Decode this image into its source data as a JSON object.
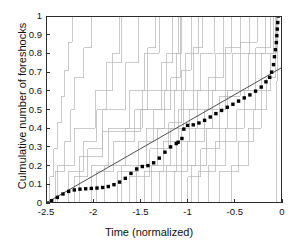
{
  "chart_data": {
    "type": "line",
    "title": "",
    "xlabel": "Time (normalized)",
    "ylabel": "Culmulative number of foreshocks",
    "xlim": [
      -2.5,
      0
    ],
    "ylim": [
      0,
      1
    ],
    "xticks": [
      -2.5,
      -2,
      -1.5,
      -1,
      -0.5,
      0
    ],
    "xticklabels": [
      "-2.5",
      "-2",
      "-1.5",
      "-1",
      "-0.5",
      "0"
    ],
    "yticks": [
      0,
      0.1,
      0.2,
      0.3,
      0.4,
      0.5,
      0.6,
      0.7,
      0.8,
      0.9,
      1
    ],
    "yticklabels": [
      "0",
      "0.1",
      "0.2",
      "0.3",
      "0.4",
      "0.5",
      "0.6",
      "0.7",
      "0.8",
      "0.9",
      "1"
    ],
    "grid": false,
    "legend": null,
    "colors": {
      "stack_lines": "#b3b3b3",
      "reference_line": "#3a3a3a",
      "stacked_mean_dots": "#000000",
      "axis": "#2b2b2b",
      "background": "#ffffff"
    },
    "series": [
      {
        "name": "stacked mean (dotted)",
        "style": "dotted-markers",
        "color": "#000000",
        "marker_size": 3.4,
        "x": [
          -2.5,
          -2.44,
          -2.38,
          -2.32,
          -2.26,
          -2.2,
          -2.14,
          -2.08,
          -2.02,
          -1.96,
          -1.9,
          -1.84,
          -1.78,
          -1.72,
          -1.66,
          -1.6,
          -1.54,
          -1.48,
          -1.42,
          -1.36,
          -1.3,
          -1.24,
          -1.18,
          -1.12,
          -1.1,
          -1.06,
          -1.04,
          -1.0,
          -0.94,
          -0.88,
          -0.82,
          -0.76,
          -0.7,
          -0.64,
          -0.58,
          -0.52,
          -0.46,
          -0.4,
          -0.34,
          -0.28,
          -0.22,
          -0.17,
          -0.13,
          -0.11,
          -0.09,
          -0.08,
          -0.07,
          -0.06,
          -0.055,
          -0.05,
          -0.045,
          -0.04
        ],
        "y": [
          0.0,
          0.012,
          0.03,
          0.048,
          0.062,
          0.07,
          0.074,
          0.076,
          0.078,
          0.08,
          0.083,
          0.088,
          0.098,
          0.112,
          0.132,
          0.158,
          0.182,
          0.195,
          0.2,
          0.215,
          0.24,
          0.272,
          0.3,
          0.318,
          0.325,
          0.345,
          0.395,
          0.415,
          0.418,
          0.428,
          0.442,
          0.46,
          0.478,
          0.495,
          0.512,
          0.528,
          0.545,
          0.562,
          0.578,
          0.598,
          0.62,
          0.648,
          0.672,
          0.7,
          0.74,
          0.782,
          0.82,
          0.858,
          0.895,
          0.93,
          0.965,
          1.0
        ]
      },
      {
        "name": "reference line",
        "style": "solid-thin",
        "color": "#3a3a3a",
        "x": [
          -2.5,
          0.0
        ],
        "y": [
          0.0,
          0.725
        ]
      }
    ],
    "step_curves_note": "26 light-gray individual cumulative step (staircase) curves, each rising from 0 to 1 across the window",
    "step_curves": [
      {
        "x": [
          -2.5,
          -2.46,
          -2.46,
          -2.42,
          -2.42,
          -2.38,
          -2.38,
          -2.34,
          -2.34,
          -2.3,
          -2.3,
          -2.26,
          -2.26,
          -2.22,
          -2.22,
          -2.18,
          -2.18,
          0.0
        ],
        "y": [
          0.0,
          0.0,
          0.14,
          0.14,
          0.29,
          0.29,
          0.43,
          0.43,
          0.57,
          0.57,
          0.71,
          0.71,
          0.86,
          0.86,
          1.0,
          1.0,
          1.0,
          1.0
        ]
      },
      {
        "x": [
          -2.5,
          -2.4,
          -2.4,
          -2.3,
          -2.3,
          -2.24,
          -2.24,
          -2.2,
          -2.2,
          -2.1,
          -2.1,
          -2.02,
          -2.02,
          0.0
        ],
        "y": [
          0.0,
          0.0,
          0.17,
          0.17,
          0.33,
          0.33,
          0.5,
          0.5,
          0.67,
          0.67,
          0.83,
          0.83,
          1.0,
          1.0
        ]
      },
      {
        "x": [
          -2.48,
          -2.38,
          -2.38,
          -2.2,
          -2.2,
          -1.98,
          -1.98,
          -1.8,
          -1.8,
          -1.72,
          -1.72,
          0.0
        ],
        "y": [
          0.0,
          0.0,
          0.2,
          0.2,
          0.4,
          0.4,
          0.6,
          0.6,
          0.8,
          0.8,
          1.0,
          1.0
        ]
      },
      {
        "x": [
          -2.42,
          -2.26,
          -2.26,
          -2.1,
          -2.1,
          -1.96,
          -1.96,
          -1.86,
          -1.86,
          -1.7,
          -1.7,
          0.0
        ],
        "y": [
          0.0,
          0.0,
          0.17,
          0.17,
          0.33,
          0.33,
          0.5,
          0.5,
          0.75,
          0.75,
          1.0,
          1.0
        ]
      },
      {
        "x": [
          -2.36,
          -2.2,
          -2.2,
          -2.06,
          -2.06,
          -1.9,
          -1.9,
          -1.66,
          -1.66,
          -1.52,
          -1.52,
          0.0
        ],
        "y": [
          0.0,
          0.0,
          0.14,
          0.14,
          0.29,
          0.29,
          0.5,
          0.5,
          0.75,
          0.75,
          1.0,
          1.0
        ]
      },
      {
        "x": [
          -2.3,
          -2.02,
          -2.02,
          -1.84,
          -1.84,
          -1.62,
          -1.62,
          -1.46,
          -1.46,
          -1.3,
          -1.3,
          0.0
        ],
        "y": [
          0.0,
          0.0,
          0.2,
          0.2,
          0.4,
          0.4,
          0.6,
          0.6,
          0.8,
          0.8,
          1.0,
          1.0
        ]
      },
      {
        "x": [
          -2.28,
          -1.96,
          -1.96,
          -1.78,
          -1.78,
          -1.56,
          -1.56,
          -1.42,
          -1.42,
          -1.34,
          -1.34,
          0.0
        ],
        "y": [
          0.0,
          0.0,
          0.17,
          0.17,
          0.33,
          0.33,
          0.5,
          0.5,
          0.83,
          0.83,
          1.0,
          1.0
        ]
      },
      {
        "x": [
          -2.22,
          -2.14,
          -2.14,
          -1.9,
          -1.9,
          -1.5,
          -1.5,
          -1.28,
          -1.28,
          -1.16,
          -1.16,
          0.0
        ],
        "y": [
          0.0,
          0.0,
          0.25,
          0.25,
          0.38,
          0.38,
          0.5,
          0.5,
          0.75,
          0.75,
          1.0,
          1.0
        ]
      },
      {
        "x": [
          -2.16,
          -1.88,
          -1.88,
          -1.66,
          -1.66,
          -1.48,
          -1.48,
          -1.22,
          -1.22,
          -1.1,
          -1.1,
          0.0
        ],
        "y": [
          0.0,
          0.0,
          0.2,
          0.2,
          0.4,
          0.4,
          0.6,
          0.6,
          0.8,
          0.8,
          1.0,
          1.0
        ]
      },
      {
        "x": [
          -2.1,
          -1.74,
          -1.74,
          -1.52,
          -1.52,
          -1.36,
          -1.36,
          -1.18,
          -1.18,
          -1.08,
          -1.08,
          0.0
        ],
        "y": [
          0.0,
          0.0,
          0.17,
          0.17,
          0.33,
          0.33,
          0.5,
          0.5,
          0.67,
          0.67,
          1.0,
          1.0
        ]
      },
      {
        "x": [
          -2.04,
          -1.7,
          -1.7,
          -1.44,
          -1.44,
          -1.24,
          -1.24,
          -1.12,
          -1.12,
          -1.06,
          -1.06,
          0.0
        ],
        "y": [
          0.0,
          0.0,
          0.2,
          0.2,
          0.4,
          0.4,
          0.6,
          0.6,
          0.8,
          0.8,
          1.0,
          1.0
        ]
      },
      {
        "x": [
          -1.98,
          -1.62,
          -1.62,
          -1.4,
          -1.4,
          -1.2,
          -1.2,
          -1.06,
          -1.06,
          -0.96,
          -0.96,
          0.0
        ],
        "y": [
          0.0,
          0.0,
          0.14,
          0.14,
          0.29,
          0.29,
          0.43,
          0.43,
          0.71,
          0.71,
          1.0,
          1.0
        ]
      },
      {
        "x": [
          -1.86,
          -1.54,
          -1.54,
          -1.32,
          -1.32,
          -1.14,
          -1.14,
          -1.02,
          -1.02,
          -0.88,
          -0.88,
          0.0
        ],
        "y": [
          0.0,
          0.0,
          0.2,
          0.2,
          0.4,
          0.4,
          0.6,
          0.6,
          0.8,
          0.8,
          1.0,
          1.0
        ]
      },
      {
        "x": [
          -1.76,
          -1.46,
          -1.46,
          -1.26,
          -1.26,
          -1.1,
          -1.1,
          -0.94,
          -0.94,
          -0.84,
          -0.84,
          0.0
        ],
        "y": [
          0.0,
          0.0,
          0.17,
          0.17,
          0.33,
          0.33,
          0.5,
          0.5,
          0.83,
          0.83,
          1.0,
          1.0
        ]
      },
      {
        "x": [
          -1.64,
          -1.38,
          -1.38,
          -1.18,
          -1.18,
          -1.04,
          -1.04,
          -0.86,
          -0.86,
          -0.72,
          -0.72,
          0.0
        ],
        "y": [
          0.0,
          0.0,
          0.2,
          0.2,
          0.4,
          0.4,
          0.6,
          0.6,
          0.8,
          0.8,
          1.0,
          1.0
        ]
      },
      {
        "x": [
          -1.52,
          -1.3,
          -1.3,
          -1.12,
          -1.12,
          -0.98,
          -0.98,
          -0.78,
          -0.78,
          -0.62,
          -0.62,
          0.0
        ],
        "y": [
          0.0,
          0.0,
          0.17,
          0.17,
          0.33,
          0.33,
          0.5,
          0.5,
          0.67,
          0.67,
          1.0,
          1.0
        ]
      },
      {
        "x": [
          -1.4,
          -1.22,
          -1.22,
          -1.06,
          -1.06,
          -0.9,
          -0.9,
          -0.7,
          -0.7,
          -0.54,
          -0.54,
          0.0
        ],
        "y": [
          0.0,
          0.0,
          0.2,
          0.2,
          0.4,
          0.4,
          0.6,
          0.6,
          0.8,
          0.8,
          1.0,
          1.0
        ]
      },
      {
        "x": [
          -1.28,
          -1.14,
          -1.14,
          -1.0,
          -1.0,
          -0.82,
          -0.82,
          -0.6,
          -0.6,
          -0.44,
          -0.44,
          0.0
        ],
        "y": [
          0.0,
          0.0,
          0.17,
          0.17,
          0.33,
          0.33,
          0.5,
          0.5,
          0.83,
          0.83,
          1.0,
          1.0
        ]
      },
      {
        "x": [
          -1.16,
          -1.06,
          -1.06,
          -0.92,
          -0.92,
          -0.74,
          -0.74,
          -0.52,
          -0.52,
          -0.34,
          -0.34,
          0.0
        ],
        "y": [
          0.0,
          0.0,
          0.2,
          0.2,
          0.4,
          0.4,
          0.6,
          0.6,
          0.8,
          0.8,
          1.0,
          1.0
        ]
      },
      {
        "x": [
          -1.08,
          -1.0,
          -1.0,
          -0.86,
          -0.86,
          -0.66,
          -0.66,
          -0.44,
          -0.44,
          -0.26,
          -0.26,
          0.0
        ],
        "y": [
          0.0,
          0.0,
          0.14,
          0.14,
          0.29,
          0.29,
          0.57,
          0.57,
          0.86,
          0.86,
          1.0,
          1.0
        ]
      },
      {
        "x": [
          -1.06,
          -0.96,
          -0.96,
          -0.8,
          -0.8,
          -0.58,
          -0.58,
          -0.36,
          -0.36,
          -0.18,
          -0.18,
          0.0
        ],
        "y": [
          0.0,
          0.0,
          0.2,
          0.2,
          0.4,
          0.4,
          0.6,
          0.6,
          0.8,
          0.8,
          1.0,
          1.0
        ]
      },
      {
        "x": [
          -1.05,
          -0.88,
          -0.88,
          -0.7,
          -0.7,
          -0.48,
          -0.48,
          -0.28,
          -0.28,
          -0.12,
          -0.12,
          0.0
        ],
        "y": [
          0.0,
          0.0,
          0.17,
          0.17,
          0.33,
          0.33,
          0.5,
          0.5,
          0.83,
          0.83,
          1.0,
          1.0
        ]
      },
      {
        "x": [
          -1.04,
          -0.78,
          -0.78,
          -0.6,
          -0.6,
          -0.4,
          -0.4,
          -0.22,
          -0.22,
          -0.09,
          -0.09,
          0.0
        ],
        "y": [
          0.0,
          0.0,
          0.2,
          0.2,
          0.4,
          0.4,
          0.6,
          0.6,
          0.8,
          0.8,
          1.0,
          1.0
        ]
      },
      {
        "x": [
          -1.03,
          -0.66,
          -0.66,
          -0.46,
          -0.46,
          -0.3,
          -0.3,
          -0.16,
          -0.16,
          -0.07,
          -0.07,
          0.0
        ],
        "y": [
          0.0,
          0.0,
          0.17,
          0.17,
          0.33,
          0.33,
          0.5,
          0.5,
          0.67,
          0.67,
          1.0,
          1.0
        ]
      },
      {
        "x": [
          -0.9,
          -0.54,
          -0.54,
          -0.36,
          -0.36,
          -0.22,
          -0.22,
          -0.12,
          -0.12,
          -0.06,
          -0.06,
          0.0
        ],
        "y": [
          0.0,
          0.0,
          0.2,
          0.2,
          0.4,
          0.4,
          0.6,
          0.6,
          0.8,
          0.8,
          1.0,
          1.0
        ]
      },
      {
        "x": [
          -0.07,
          -0.06,
          -0.06,
          -0.055,
          -0.055,
          -0.05,
          -0.05,
          0.0
        ],
        "y": [
          0.0,
          0.0,
          0.3,
          0.3,
          0.65,
          0.65,
          1.0,
          1.0
        ]
      }
    ]
  }
}
